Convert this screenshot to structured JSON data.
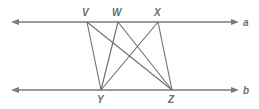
{
  "diagram": {
    "lines": [
      {
        "name": "a",
        "label": "a",
        "y": 22
      },
      {
        "name": "b",
        "label": "b",
        "y": 90
      }
    ],
    "points": {
      "V": {
        "label": "V",
        "x": 87,
        "y": 22
      },
      "W": {
        "label": "W",
        "x": 118,
        "y": 22
      },
      "X": {
        "label": "X",
        "x": 158,
        "y": 22
      },
      "Y": {
        "label": "Y",
        "x": 101,
        "y": 90
      },
      "Z": {
        "label": "Z",
        "x": 172,
        "y": 90
      }
    },
    "segments": [
      [
        "V",
        "Y"
      ],
      [
        "V",
        "Z"
      ],
      [
        "W",
        "Y"
      ],
      [
        "W",
        "Z"
      ],
      [
        "X",
        "Y"
      ],
      [
        "X",
        "Z"
      ]
    ]
  }
}
